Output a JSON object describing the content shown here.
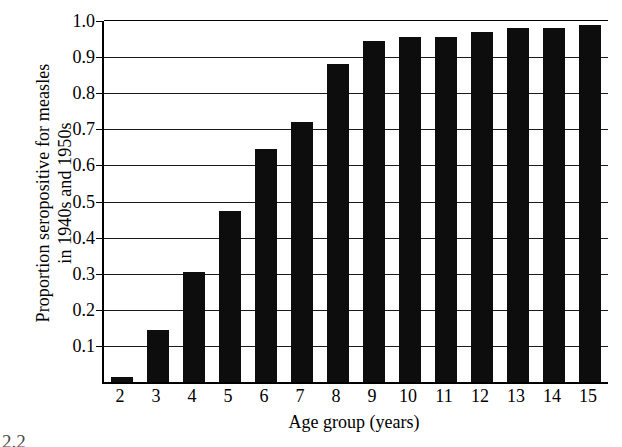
{
  "figure": {
    "caption_fragment": "2.2"
  },
  "chart_data": {
    "type": "bar",
    "title": "",
    "xlabel": "Age group (years)",
    "ylabel_lines": [
      "Proportion seropositive for measles",
      "in 1940s and 1950s"
    ],
    "ylabel": "Proportion seropositive for measles in 1940s and 1950s",
    "categories": [
      "2",
      "3",
      "4",
      "5",
      "6",
      "7",
      "8",
      "9",
      "10",
      "11",
      "12",
      "13",
      "14",
      "15"
    ],
    "values": [
      0.015,
      0.145,
      0.305,
      0.475,
      0.645,
      0.72,
      0.88,
      0.945,
      0.955,
      0.955,
      0.97,
      0.98,
      0.98,
      0.99
    ],
    "ylim": [
      0.0,
      1.0
    ],
    "yticks": [
      1.0,
      0.9,
      0.8,
      0.7,
      0.6,
      0.5,
      0.4,
      0.3,
      0.2,
      0.1
    ],
    "ytick_labels": [
      "1.0",
      "0.9",
      "0.8",
      "0.7",
      "0.6",
      "0.5",
      "0.4",
      "0.3",
      "0.2",
      "0.1"
    ],
    "grid": true,
    "legend": "none",
    "bar_color": "#0d0d0d",
    "background_color": "#ffffff"
  }
}
